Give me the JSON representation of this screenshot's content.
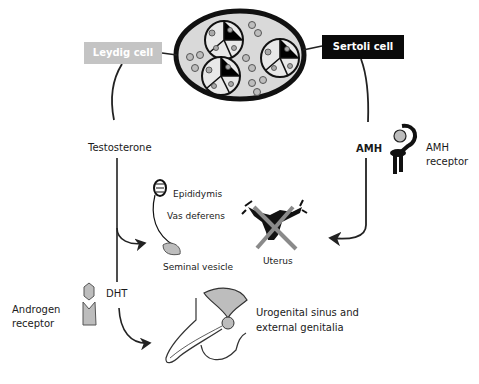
{
  "diagram": {
    "nodes": {
      "leydig_cell": "Leydig cell",
      "sertoli_cell": "Sertoli cell",
      "testosterone": "Testosterone",
      "amh": "AMH",
      "amh_receptor_line1": "AMH",
      "amh_receptor_line2": "receptor",
      "epididymis": "Epididymis",
      "vas_deferens": "Vas deferens",
      "seminal_vesicle": "Seminal vesicle",
      "uterus": "Uterus",
      "dht": "DHT",
      "androgen_receptor_line1": "Androgen",
      "androgen_receptor_line2": "receptor",
      "urogenital_line1": "Urogenital sinus and",
      "urogenital_line2": "external genitalia"
    },
    "colors": {
      "leydig_box": "#c4c4c4",
      "sertoli_box": "#0a0a0a",
      "testis_fill": "#d9d9d9",
      "receptor_fill": "#bdbdbd",
      "cross": "#8a8a8a"
    },
    "edges": [
      {
        "from": "Leydig cell",
        "to": "Testosterone"
      },
      {
        "from": "Testosterone",
        "to": "Epididymis / Vas deferens / Seminal vesicle"
      },
      {
        "from": "Testosterone",
        "to": "DHT"
      },
      {
        "from": "DHT",
        "to": "Urogenital sinus and external genitalia"
      },
      {
        "from": "Sertoli cell",
        "to": "AMH"
      },
      {
        "from": "AMH",
        "to": "Uterus",
        "effect": "regression (crossed out)"
      }
    ]
  }
}
